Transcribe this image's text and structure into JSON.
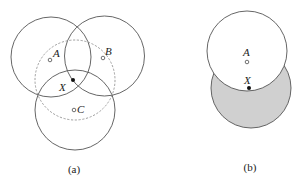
{
  "panel_a": {
    "caption": "(a)",
    "circles": [
      {
        "name": "circle-A",
        "cx": 51,
        "cy": 57,
        "r": 40,
        "style": "solid"
      },
      {
        "name": "circle-B",
        "cx": 104.5,
        "cy": 56,
        "r": 40,
        "style": "solid"
      },
      {
        "name": "circle-C",
        "cx": 75,
        "cy": 110,
        "r": 40,
        "style": "solid"
      },
      {
        "name": "circle-X",
        "cx": 75,
        "cy": 80,
        "r": 40,
        "style": "dashed"
      }
    ],
    "points": {
      "A": {
        "label": "A",
        "x": 50,
        "y": 60,
        "type": "hollow"
      },
      "B": {
        "label": "B",
        "x": 103,
        "y": 58,
        "type": "hollow"
      },
      "C": {
        "label": "C",
        "x": 73,
        "y": 111,
        "type": "hollow"
      },
      "X": {
        "label": "X",
        "x": 73,
        "y": 80,
        "type": "filled"
      }
    }
  },
  "panel_b": {
    "caption": "(b)",
    "shaded_fill": "#d0d0d0",
    "circles": [
      {
        "name": "circle-X-shaded",
        "cx": 251,
        "cy": 88,
        "r": 40,
        "fill": "#d0d0d0"
      },
      {
        "name": "circle-A-white",
        "cx": 247,
        "cy": 51,
        "r": 40,
        "fill": "#ffffff"
      }
    ],
    "points": {
      "A": {
        "label": "A",
        "x": 247,
        "y": 62,
        "type": "hollow"
      },
      "X": {
        "label": "X",
        "x": 249,
        "y": 88,
        "type": "filled"
      }
    }
  },
  "colors": {
    "stroke": "#555555",
    "dashed_stroke": "#888888",
    "point": "#111111"
  }
}
